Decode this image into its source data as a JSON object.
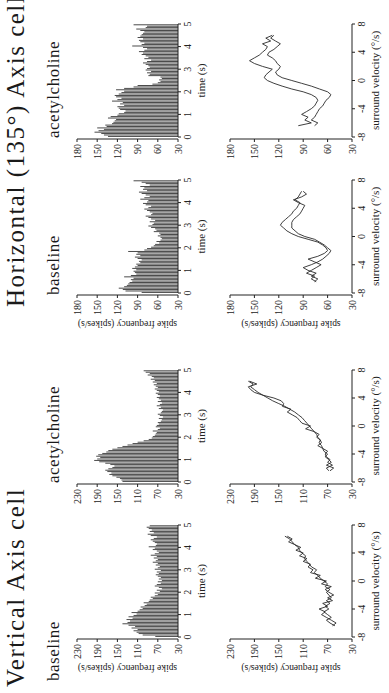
{
  "figure": {
    "orientation": "rotated 90 degrees counter-clockwise",
    "groups": [
      {
        "title": "Vertical Axis cell",
        "conditions": [
          {
            "label": "baseline"
          },
          {
            "label": "acetylcholine"
          }
        ]
      },
      {
        "title": "Horizontal (135°) Axis cell",
        "conditions": [
          {
            "label": "baseline"
          },
          {
            "label": "acetylcholine"
          }
        ]
      }
    ],
    "histogram_xlabel": "time (s)",
    "line_xlabel": "surround velocity (°/s)",
    "ylabel": "spike frequency (spikes/s)",
    "colors": {
      "bars": "#3a3a3a",
      "axes": "#222222",
      "line": "#2a2a2a",
      "background": "#ffffff"
    }
  },
  "chart_data": [
    {
      "id": "vertical-baseline-histogram",
      "type": "bar",
      "title": "Vertical Axis cell — baseline",
      "xlabel": "time (s)",
      "ylabel": "spike frequency (spikes/s)",
      "xlim": [
        0,
        5
      ],
      "ylim": [
        30,
        230
      ],
      "xticks": [
        0,
        1,
        2,
        3,
        4,
        5
      ],
      "yticks": [
        30,
        70,
        110,
        150,
        190,
        230
      ],
      "bin_width": 0.1,
      "values": [
        75,
        100,
        108,
        112,
        118,
        110,
        122,
        115,
        128,
        140,
        130,
        125,
        132,
        120,
        128,
        118,
        112,
        122,
        110,
        106,
        100,
        104,
        96,
        92,
        98,
        88,
        86,
        80,
        84,
        76,
        70,
        76,
        66,
        72,
        62,
        68,
        76,
        72,
        64,
        70,
        62,
        68,
        64,
        70,
        74,
        68,
        72,
        64,
        76,
        70,
        66,
        74,
        70,
        80,
        74,
        70,
        78,
        72,
        84,
        76,
        68,
        72,
        80,
        76,
        88,
        74,
        72,
        76,
        80,
        84,
        78,
        72,
        84,
        90,
        78,
        86,
        82,
        88,
        92,
        86
      ]
    },
    {
      "id": "vertical-acetylcholine-histogram",
      "type": "bar",
      "title": "Vertical Axis cell — acetylcholine",
      "xlabel": "time (s)",
      "ylabel": "spike frequency (spikes/s)",
      "xlim": [
        0,
        5
      ],
      "ylim": [
        30,
        230
      ],
      "xticks": [
        0,
        1,
        2,
        3,
        4,
        5
      ],
      "yticks": [
        30,
        70,
        110,
        150,
        190,
        230
      ],
      "bin_width": 0.1,
      "values": [
        140,
        142,
        145,
        152,
        160,
        166,
        162,
        170,
        174,
        168,
        160,
        156,
        164,
        174,
        186,
        196,
        190,
        184,
        192,
        188,
        180,
        172,
        168,
        160,
        150,
        140,
        130,
        120,
        110,
        98,
        88,
        82,
        80,
        76,
        74,
        72,
        80,
        70,
        66,
        74,
        72,
        68,
        70,
        64,
        62,
        68,
        60,
        66,
        70,
        64,
        62,
        60,
        68,
        64,
        72,
        66,
        62,
        70,
        64,
        68,
        72,
        66,
        70,
        74,
        68,
        72,
        76,
        70,
        74,
        78,
        72,
        80,
        76,
        84,
        78,
        82,
        90,
        86,
        94,
        98
      ]
    },
    {
      "id": "horizontal-baseline-histogram",
      "type": "bar",
      "title": "Horizontal (135°) Axis cell — baseline",
      "xlabel": "time (s)",
      "ylabel": "spike frequency (spikes/s)",
      "xlim": [
        0,
        5
      ],
      "ylim": [
        30,
        180
      ],
      "xticks": [
        0,
        1,
        2,
        3,
        4,
        5
      ],
      "yticks": [
        30,
        60,
        90,
        120,
        150,
        180
      ],
      "bin_width": 0.1,
      "values": [
        84,
        108,
        112,
        118,
        110,
        106,
        104,
        102,
        98,
        100,
        96,
        110,
        100,
        92,
        94,
        96,
        92,
        98,
        94,
        90,
        92,
        86,
        88,
        84,
        90,
        94,
        86,
        92,
        90,
        104,
        80,
        76,
        70,
        66,
        64,
        58,
        62,
        56,
        54,
        56,
        60,
        56,
        58,
        66,
        62,
        64,
        70,
        74,
        68,
        66,
        72,
        64,
        70,
        74,
        78,
        70,
        68,
        72,
        76,
        80,
        74,
        70,
        78,
        82,
        76,
        74,
        86,
        80,
        72,
        78,
        84,
        88,
        76,
        82,
        80,
        86,
        72,
        78,
        84,
        96
      ]
    },
    {
      "id": "horizontal-acetylcholine-histogram",
      "type": "bar",
      "title": "Horizontal (135°) Axis cell — acetylcholine",
      "xlabel": "time (s)",
      "ylabel": "spike frequency (spikes/s)",
      "xlim": [
        0,
        5
      ],
      "ylim": [
        30,
        180
      ],
      "xticks": [
        0,
        1,
        2,
        3,
        4,
        5
      ],
      "yticks": [
        30,
        60,
        90,
        120,
        150,
        180
      ],
      "bin_width": 0.1,
      "values": [
        134,
        140,
        144,
        154,
        148,
        140,
        150,
        136,
        138,
        128,
        126,
        124,
        122,
        134,
        130,
        120,
        118,
        110,
        108,
        116,
        118,
        120,
        110,
        116,
        112,
        128,
        120,
        114,
        122,
        124,
        118,
        114,
        110,
        122,
        110,
        96,
        90,
        68,
        60,
        56,
        58,
        54,
        56,
        74,
        72,
        76,
        70,
        78,
        76,
        72,
        74,
        78,
        82,
        76,
        70,
        80,
        74,
        78,
        84,
        82,
        88,
        80,
        76,
        82,
        98,
        84,
        80,
        86,
        88,
        82,
        90,
        86,
        84,
        82,
        80,
        86,
        92,
        78,
        76,
        96
      ]
    },
    {
      "id": "vertical-baseline-velocity",
      "type": "line",
      "title": "Vertical Axis cell — baseline",
      "xlabel": "surround velocity (°/s)",
      "ylabel": "spike frequency (spikes/s)",
      "xlim": [
        -8,
        8
      ],
      "ylim": [
        30,
        230
      ],
      "xticks": [
        -8,
        -4,
        0,
        4,
        8
      ],
      "yticks": [
        30,
        70,
        110,
        150,
        190,
        230
      ],
      "x": [
        -6.4,
        -6.0,
        -5.6,
        -5.2,
        -4.8,
        -4.4,
        -4.0,
        -3.6,
        -3.2,
        -2.8,
        -2.4,
        -2.0,
        -1.6,
        -1.2,
        -0.8,
        -0.4,
        0.0,
        0.4,
        0.8,
        1.2,
        1.6,
        2.0,
        2.4,
        2.8,
        3.2,
        3.6,
        4.0,
        4.4,
        4.8,
        5.2,
        5.6,
        6.0,
        6.4
      ],
      "series": [
        {
          "name": "acceleration",
          "values": [
            58,
            66,
            72,
            64,
            70,
            76,
            68,
            74,
            66,
            72,
            64,
            68,
            72,
            66,
            74,
            70,
            76,
            82,
            86,
            92,
            88,
            96,
            100,
            104,
            108,
            106,
            112,
            116,
            118,
            124,
            128,
            132,
            140
          ]
        },
        {
          "name": "deceleration",
          "values": [
            62,
            56,
            64,
            72,
            80,
            74,
            84,
            70,
            78,
            62,
            70,
            60,
            68,
            74,
            64,
            80,
            72,
            90,
            82,
            98,
            94,
            102,
            98,
            110,
            104,
            116,
            110,
            122,
            114,
            124,
            134,
            128,
            136
          ]
        }
      ]
    },
    {
      "id": "vertical-acetylcholine-velocity",
      "type": "line",
      "title": "Vertical Axis cell — acetylcholine",
      "xlabel": "surround velocity (°/s)",
      "ylabel": "spike frequency (spikes/s)",
      "xlim": [
        -8,
        8
      ],
      "ylim": [
        30,
        230
      ],
      "xticks": [
        -8,
        -4,
        0,
        4,
        8
      ],
      "yticks": [
        30,
        70,
        110,
        150,
        190,
        230
      ],
      "x": [
        -6.4,
        -6.0,
        -5.6,
        -5.2,
        -4.8,
        -4.4,
        -4.0,
        -3.6,
        -3.2,
        -2.8,
        -2.4,
        -2.0,
        -1.6,
        -1.2,
        -0.8,
        -0.4,
        0.0,
        0.4,
        0.8,
        1.2,
        1.6,
        2.0,
        2.4,
        2.8,
        3.2,
        3.6,
        4.0,
        4.4,
        4.8,
        5.2,
        5.6,
        6.0,
        6.4
      ],
      "series": [
        {
          "name": "acceleration",
          "values": [
            66,
            60,
            72,
            64,
            68,
            74,
            70,
            76,
            78,
            80,
            84,
            82,
            86,
            88,
            92,
            96,
            100,
            104,
            108,
            112,
            118,
            124,
            132,
            140,
            150,
            160,
            168,
            176,
            184,
            190,
            196,
            192,
            200
          ]
        },
        {
          "name": "deceleration",
          "values": [
            68,
            72,
            62,
            70,
            66,
            72,
            74,
            70,
            78,
            86,
            80,
            82,
            88,
            84,
            92,
            106,
            98,
            112,
            116,
            120,
            128,
            136,
            130,
            144,
            142,
            146,
            158,
            176,
            190,
            196,
            200,
            186,
            198
          ]
        }
      ]
    },
    {
      "id": "horizontal-baseline-velocity",
      "type": "line",
      "title": "Horizontal (135°) Axis cell — baseline",
      "xlabel": "surround velocity (°/s)",
      "ylabel": "spike frequency (spikes/s)",
      "xlim": [
        -8,
        8
      ],
      "ylim": [
        30,
        180
      ],
      "xticks": [
        -8,
        -4,
        0,
        4,
        8
      ],
      "yticks": [
        30,
        60,
        90,
        120,
        150,
        180
      ],
      "x": [
        -6.4,
        -6.0,
        -5.6,
        -5.2,
        -4.8,
        -4.4,
        -4.0,
        -3.6,
        -3.2,
        -2.8,
        -2.4,
        -2.0,
        -1.6,
        -1.2,
        -0.8,
        -0.4,
        0.0,
        0.4,
        0.8,
        1.2,
        1.6,
        2.0,
        2.4,
        2.8,
        3.2,
        3.6,
        4.0,
        4.4,
        4.8,
        5.2,
        5.6,
        6.0,
        6.4
      ],
      "series": [
        {
          "name": "acceleration",
          "values": [
            74,
            80,
            76,
            86,
            80,
            74,
            68,
            76,
            84,
            72,
            64,
            60,
            62,
            66,
            72,
            84,
            96,
            104,
            110,
            114,
            118,
            116,
            112,
            108,
            104,
            102,
            98,
            96,
            94,
            100,
            96,
            94,
            92
          ]
        },
        {
          "name": "deceleration",
          "values": [
            76,
            72,
            80,
            74,
            84,
            90,
            80,
            72,
            66,
            62,
            58,
            56,
            60,
            64,
            70,
            76,
            88,
            96,
            100,
            104,
            104,
            104,
            102,
            98,
            94,
            92,
            90,
            88,
            96,
            102,
            92,
            86,
            90
          ]
        }
      ]
    },
    {
      "id": "horizontal-acetylcholine-velocity",
      "type": "line",
      "title": "Horizontal (135°) Axis cell — acetylcholine",
      "xlabel": "surround velocity (°/s)",
      "ylabel": "spike frequency (spikes/s)",
      "xlim": [
        -8,
        8
      ],
      "ylim": [
        30,
        180
      ],
      "xticks": [
        -8,
        -4,
        0,
        4,
        8
      ],
      "yticks": [
        30,
        60,
        90,
        120,
        150,
        180
      ],
      "x": [
        -6.4,
        -6.0,
        -5.6,
        -5.2,
        -4.8,
        -4.4,
        -4.0,
        -3.6,
        -3.2,
        -2.8,
        -2.4,
        -2.0,
        -1.6,
        -1.2,
        -0.8,
        -0.4,
        0.0,
        0.4,
        0.8,
        1.2,
        1.6,
        2.0,
        2.4,
        2.8,
        3.2,
        3.6,
        4.0,
        4.4,
        4.8,
        5.2,
        5.6,
        6.0,
        6.4
      ],
      "series": [
        {
          "name": "acceleration",
          "values": [
            96,
            80,
            88,
            84,
            92,
            86,
            80,
            76,
            74,
            72,
            74,
            80,
            90,
            104,
            116,
            126,
            134,
            138,
            136,
            132,
            128,
            140,
            150,
            156,
            150,
            144,
            140,
            136,
            134,
            140,
            130,
            136,
            128
          ]
        },
        {
          "name": "deceleration",
          "values": [
            76,
            72,
            80,
            76,
            74,
            72,
            70,
            66,
            64,
            62,
            58,
            56,
            60,
            70,
            80,
            92,
            104,
            116,
            122,
            124,
            120,
            118,
            122,
            124,
            128,
            134,
            132,
            126,
            122,
            118,
            124,
            130,
            126
          ]
        }
      ]
    }
  ]
}
